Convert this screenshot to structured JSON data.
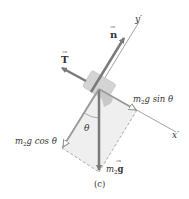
{
  "figure": {
    "caption": "(c)",
    "colors": {
      "background": "#ffffff",
      "arrow": "#7a7a7a",
      "axis": "#8a8a8a",
      "block": "#d4d4d4",
      "shade": "#ececec",
      "text": "#333333"
    }
  },
  "axes": {
    "y_prime": {
      "label": "y",
      "prime": "′"
    },
    "x_prime": {
      "label": "x",
      "prime": "′"
    }
  },
  "forces": {
    "normal": {
      "symbol": "n",
      "vector_mark": "→"
    },
    "tension": {
      "symbol": "T",
      "vector_mark": "→"
    },
    "weight": {
      "label_m": "m",
      "label_sub": "2",
      "label_g": "g",
      "vector_mark": "→"
    },
    "weight_sin": {
      "label_m": "m",
      "label_sub": "2",
      "label_rest": "g sin θ"
    },
    "weight_cos": {
      "label_m": "m",
      "label_sub": "2",
      "label_rest": "g cos θ"
    }
  },
  "angle": {
    "symbol": "θ"
  }
}
